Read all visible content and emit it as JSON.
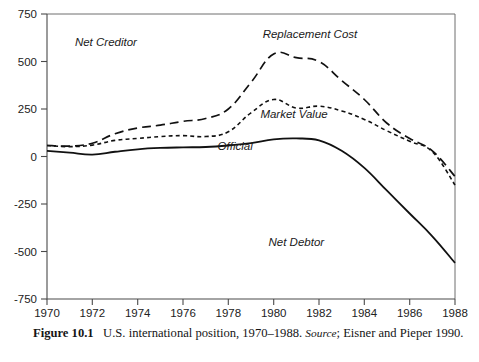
{
  "chart_data": {
    "type": "line",
    "xlabel": "",
    "ylabel": "",
    "xlim": [
      1970,
      1988
    ],
    "ylim": [
      -750,
      750
    ],
    "grid": false,
    "legend_position": "inline-annotations",
    "x": [
      1970,
      1971,
      1972,
      1973,
      1974,
      1975,
      1976,
      1977,
      1978,
      1979,
      1980,
      1981,
      1982,
      1983,
      1984,
      1985,
      1986,
      1987,
      1988
    ],
    "y_ticks": [
      750,
      500,
      250,
      0,
      -250,
      -500,
      -750
    ],
    "x_ticks": [
      1970,
      1972,
      1974,
      1976,
      1978,
      1980,
      1982,
      1984,
      1986,
      1988
    ],
    "series": [
      {
        "name": "Replacement Cost",
        "style": "long-dash",
        "values": [
          58,
          55,
          70,
          120,
          150,
          165,
          185,
          200,
          250,
          390,
          540,
          520,
          500,
          400,
          300,
          175,
          95,
          30,
          -105
        ]
      },
      {
        "name": "Market Value",
        "style": "short-dash",
        "values": [
          58,
          52,
          60,
          85,
          95,
          105,
          110,
          105,
          130,
          230,
          300,
          255,
          265,
          240,
          195,
          135,
          80,
          25,
          -150
        ]
      },
      {
        "name": "Official",
        "style": "solid",
        "values": [
          30,
          20,
          10,
          25,
          38,
          45,
          48,
          50,
          58,
          70,
          90,
          95,
          85,
          30,
          -60,
          -180,
          -300,
          -420,
          -560
        ]
      }
    ],
    "annotations": [
      {
        "text": "Net Creditor",
        "x": 1972.6,
        "y": 580
      },
      {
        "text": "Net Debtor",
        "x": 1981.0,
        "y": -470
      },
      {
        "text": "Replacement Cost",
        "x": 1981.6,
        "y": 625
      },
      {
        "text": "Market Value",
        "x": 1980.9,
        "y": 205
      },
      {
        "text": "Official",
        "x": 1978.3,
        "y": 35
      }
    ]
  },
  "caption": {
    "figure_number": "Figure 10.1",
    "text": "U.S. international position, 1970–1988.",
    "source_label": "Source",
    "source_text": "; Eisner and Pieper 1990."
  },
  "colors": {
    "line": "#111111",
    "axis": "#4a4a4a",
    "frame": "#6e6e6e",
    "background": "#ffffff",
    "text": "#1a1a1a"
  }
}
